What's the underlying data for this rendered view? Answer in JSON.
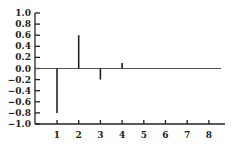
{
  "chart_data": {
    "type": "stem",
    "title": "",
    "xlabel": "",
    "ylabel": "",
    "x": [
      1,
      2,
      3,
      4,
      5,
      6,
      7,
      8
    ],
    "values": [
      -0.8,
      0.6,
      -0.2,
      0.1,
      0,
      0,
      0,
      0
    ],
    "xticks": [
      "1",
      "2",
      "3",
      "4",
      "5",
      "6",
      "7",
      "8"
    ],
    "yticks": [
      "1.0",
      "0.8",
      "0.6",
      "0.4",
      "0.2",
      "0.0",
      "−0.2",
      "−0.4",
      "−0.6",
      "−0.8",
      "−1.0"
    ],
    "ylim": [
      -1.0,
      1.0
    ],
    "xlim": [
      0,
      8.6
    ],
    "grid": false,
    "legend": null,
    "colors": {
      "line": "#222222",
      "zero_line": "#555555"
    }
  }
}
